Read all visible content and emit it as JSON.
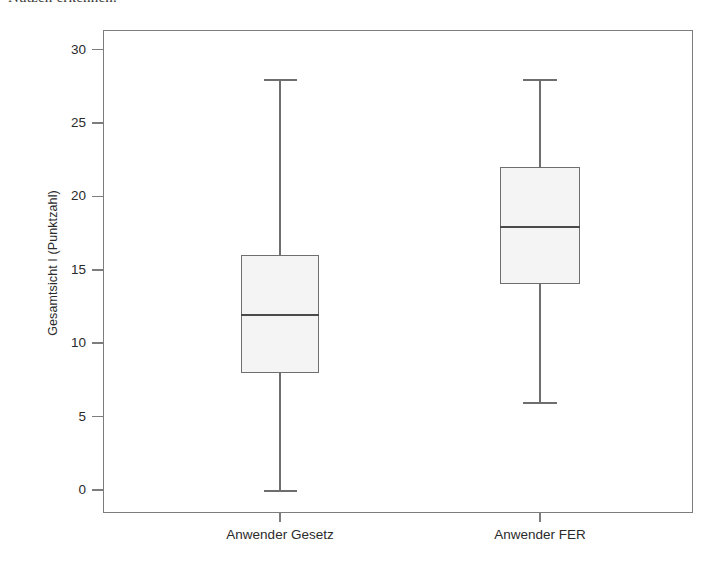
{
  "top_caption": "Nutzen erkennen.",
  "chart_data": {
    "type": "box",
    "title": "",
    "xlabel": "",
    "ylabel": "Gesamtsicht I (Punktzahl)",
    "ylim": [
      -1.4,
      31.5
    ],
    "yticks": [
      0,
      5,
      10,
      15,
      20,
      25,
      30
    ],
    "ytick_labels": [
      "0",
      "5",
      "10",
      "15",
      "20",
      "25",
      "30"
    ],
    "grid": false,
    "legend": false,
    "categories": [
      "Anwender Gesetz",
      "Anwender FER"
    ],
    "boxes": [
      {
        "label": "Anwender Gesetz",
        "min": 0,
        "q1": 8,
        "median": 12,
        "q3": 16,
        "max": 28,
        "whisker_low": 0,
        "whisker_high": 28,
        "outliers": []
      },
      {
        "label": "Anwender FER",
        "min": 6,
        "q1": 14,
        "median": 18,
        "q3": 22,
        "max": 28,
        "whisker_low": 6,
        "whisker_high": 28,
        "outliers": []
      }
    ],
    "colors": {
      "box_fill": "#f4f4f4",
      "box_edge": "#6e6e6e",
      "median": "#4a4a4a",
      "whisker": "#6e6e6e",
      "frame": "#7d7d7d",
      "text": "#2b2b2b",
      "background": "#ffffff"
    }
  }
}
